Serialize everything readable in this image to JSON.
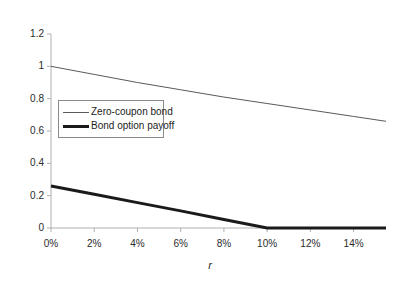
{
  "chart_data": {
    "type": "line",
    "title": "",
    "xlabel": "r",
    "ylabel": "",
    "xlim": [
      0,
      15.5
    ],
    "ylim": [
      0,
      1.2
    ],
    "grid": false,
    "legend_position": "inside-left",
    "x_tick_labels": [
      "0%",
      "2%",
      "4%",
      "6%",
      "8%",
      "10%",
      "12%",
      "14%"
    ],
    "x_tick_values": [
      0,
      2,
      4,
      6,
      8,
      10,
      12,
      14
    ],
    "y_tick_labels": [
      "0",
      "0.2",
      "0.4",
      "0.6",
      "0.8",
      "1",
      "1.2"
    ],
    "y_tick_values": [
      0,
      0.2,
      0.4,
      0.6,
      0.8,
      1.0,
      1.2
    ],
    "series": [
      {
        "name": "Zero-coupon bond",
        "color": "#595959",
        "width": 1,
        "x": [
          0,
          2,
          4,
          6,
          8,
          10,
          12,
          14,
          15.5
        ],
        "values": [
          1.0,
          0.95,
          0.9,
          0.855,
          0.81,
          0.77,
          0.73,
          0.69,
          0.66
        ]
      },
      {
        "name": "Bond option payoff",
        "color": "#1a1a1a",
        "width": 3,
        "x": [
          0,
          2,
          4,
          6,
          8,
          10,
          12,
          14,
          15.5
        ],
        "values": [
          0.26,
          0.209,
          0.157,
          0.106,
          0.053,
          0.0,
          0.0,
          0.0,
          0.0
        ]
      }
    ]
  },
  "legend": {
    "entries": [
      {
        "label": "Zero-coupon bond"
      },
      {
        "label": "Bond option payoff"
      }
    ]
  },
  "axes": {
    "x_label": "r",
    "axis_color": "#b0b0b0",
    "tick_color": "#b0b0b0"
  }
}
